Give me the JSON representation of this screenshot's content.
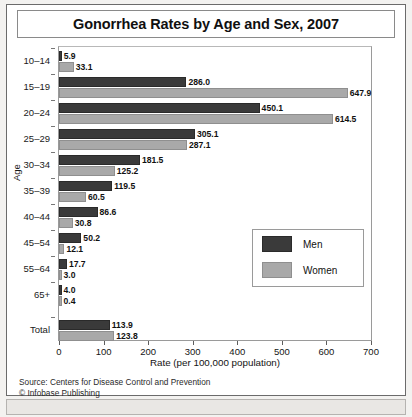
{
  "chart_data": {
    "type": "bar",
    "orientation": "horizontal",
    "title": "Gonorrhea Rates by Age and Sex, 2007",
    "xlabel": "Rate (per 100,000 population)",
    "ylabel": "Age",
    "xlim": [
      0,
      700
    ],
    "xticks": [
      0,
      100,
      200,
      300,
      400,
      500,
      600,
      700
    ],
    "grid": false,
    "legend_position": "inside-bottom-right",
    "categories": [
      "10–14",
      "15–19",
      "20–24",
      "25–29",
      "30–34",
      "35–39",
      "40–44",
      "45–54",
      "55–64",
      "65+",
      "Total"
    ],
    "series": [
      {
        "name": "Men",
        "color": "#3a3a3a",
        "values": [
          5.9,
          286.0,
          450.1,
          305.1,
          181.5,
          119.5,
          86.6,
          50.2,
          17.7,
          4.0,
          113.9
        ],
        "labels": [
          "5.9",
          "286.0",
          "450.1",
          "305.1",
          "181.5",
          "119.5",
          "86.6",
          "50.2",
          "17.7",
          "4.0",
          "113.9"
        ]
      },
      {
        "name": "Women",
        "color": "#a9a9a9",
        "values": [
          33.1,
          647.9,
          614.5,
          287.1,
          125.2,
          60.5,
          30.8,
          12.1,
          3.0,
          0.4,
          123.8
        ],
        "labels": [
          "33.1",
          "647.9",
          "614.5",
          "287.1",
          "125.2",
          "60.5",
          "30.8",
          "12.1",
          "3.0",
          "0.4",
          "123.8"
        ]
      }
    ],
    "source": "Source: Centers for Disease Control and Prevention",
    "copyright": "© Infobase Publishing"
  },
  "legend": {
    "items": [
      {
        "label": "Men",
        "color": "#3a3a3a"
      },
      {
        "label": "Women",
        "color": "#a9a9a9"
      }
    ]
  }
}
